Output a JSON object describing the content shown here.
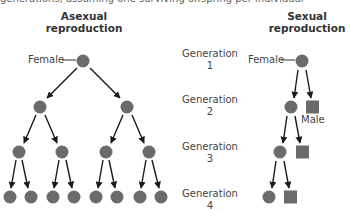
{
  "caption_fragment": "generations, assuming one surviving offspring per individual",
  "headings": {
    "asexual": "Asexual reproduction",
    "asexual_line1": "Asexual",
    "asexual_line2": "reproduction",
    "sexual_line1": "Sexual",
    "sexual_line2": "reproduction"
  },
  "generations": [
    {
      "label": "Generation",
      "number": "1"
    },
    {
      "label": "Generation",
      "number": "2"
    },
    {
      "label": "Generation",
      "number": "3"
    },
    {
      "label": "Generation",
      "number": "4"
    }
  ],
  "labels": {
    "asexual_female": "Female",
    "sexual_female": "Female",
    "sexual_male": "Male"
  },
  "colors": {
    "node_fill": "#6b6b6b",
    "arrow": "#1a1a1a",
    "text": "#3a3a3a"
  },
  "asexual_counts": [
    1,
    2,
    4,
    8
  ],
  "sexual_counts": [
    {
      "females": 1,
      "males": 0
    },
    {
      "females": 1,
      "males": 1
    },
    {
      "females": 1,
      "males": 1
    },
    {
      "females": 1,
      "males": 1
    }
  ]
}
